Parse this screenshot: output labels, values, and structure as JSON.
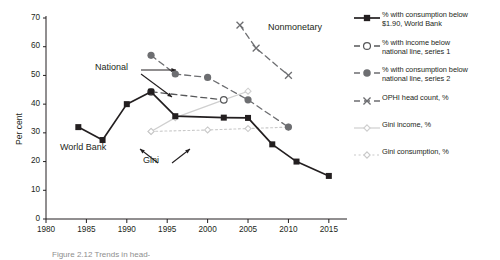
{
  "chart_data": {
    "type": "line",
    "title": "",
    "xlabel": "",
    "ylabel": "Per cent",
    "xlim": [
      1980,
      2017
    ],
    "ylim": [
      0,
      70
    ],
    "xticks": [
      1980,
      1985,
      1990,
      1995,
      2000,
      2005,
      2010,
      2015
    ],
    "yticks": [
      0,
      10,
      20,
      30,
      40,
      50,
      60,
      70
    ],
    "grid": false,
    "legend_position": "right",
    "series": [
      {
        "name": "% with consumption below\n$1.90, World Bank",
        "key": "world-bank",
        "marker": "filled-square",
        "line": "solid",
        "color": "#231f20",
        "x": [
          1984,
          1987,
          1990,
          1993,
          1996,
          2002,
          2005,
          2008,
          2011,
          2015
        ],
        "y": [
          32,
          27.5,
          40,
          44.3,
          35.8,
          35.3,
          35.2,
          26,
          20,
          15
        ]
      },
      {
        "name": "% with income below\nnational line, series 1",
        "key": "national-series-1",
        "marker": "hollow-circle",
        "line": "dashed",
        "color": "#57585a",
        "x": [
          1993,
          2002
        ],
        "y": [
          44.3,
          41.5
        ]
      },
      {
        "name": "% with consumption below\nnational line, series 2",
        "key": "national-series-2",
        "marker": "filled-circle",
        "line": "dashed",
        "color": "#6d6e71",
        "x": [
          1993,
          1996,
          2000,
          2005,
          2010
        ],
        "y": [
          57,
          50.5,
          49.3,
          41.5,
          32
        ]
      },
      {
        "name": "OPHI head count, %",
        "key": "ophi",
        "marker": "x",
        "line": "dashed",
        "color": "#6d6e71",
        "x": [
          2004,
          2006,
          2010
        ],
        "y": [
          67.5,
          59.5,
          50
        ]
      },
      {
        "name": "Gini income, %",
        "key": "gini-income",
        "marker": "small-diamond",
        "line": "solid-light",
        "color": "#cfcfcf",
        "x": [
          1993,
          1996,
          2002,
          2005
        ],
        "y": [
          30.5,
          35.3,
          41.5,
          44.5
        ]
      },
      {
        "name": "Gini consumption, %",
        "key": "gini-consumption",
        "marker": "small-diamond",
        "line": "dotted-light",
        "color": "#c9c9c9",
        "x": [
          1993,
          2000,
          2005,
          2010
        ],
        "y": [
          30.5,
          31,
          31.5,
          32
        ]
      }
    ],
    "annotations": [
      {
        "key": "nonmonetary",
        "text": "Nonmonetary",
        "x": 2005,
        "y": 64
      },
      {
        "key": "national",
        "text": "National",
        "x": 1993,
        "y": 51
      },
      {
        "key": "world-bank",
        "text": "World Bank",
        "x": 1987,
        "y": 22.5
      },
      {
        "key": "gini",
        "text": "Gini",
        "x": 1999,
        "y": 22.5
      }
    ]
  },
  "axis": {
    "y_title": "Per cent",
    "y_tick_labels": [
      "70",
      "60",
      "50",
      "40",
      "30",
      "20",
      "10",
      "0"
    ],
    "x_tick_labels": [
      "1980",
      "1985",
      "1990",
      "1995",
      "2000",
      "2005",
      "2010",
      "2015"
    ]
  },
  "annotations": {
    "nonmonetary": "Nonmonetary",
    "national": "National",
    "world_bank": "World Bank",
    "gini": "Gini"
  },
  "legend": {
    "items": [
      {
        "label": "% with consumption below\n$1.90, World Bank",
        "key": "world-bank"
      },
      {
        "label": "% with income below\nnational line, series 1",
        "key": "national-series-1"
      },
      {
        "label": "% with consumption below\nnational line, series 2",
        "key": "national-series-2"
      },
      {
        "label": "OPHI head count, %",
        "key": "ophi"
      },
      {
        "label": "Gini income, %",
        "key": "gini-income"
      },
      {
        "label": "Gini consumption, %",
        "key": "gini-consumption"
      }
    ]
  },
  "caption": {
    "text": "Figure 2.12  Trends in head-"
  }
}
